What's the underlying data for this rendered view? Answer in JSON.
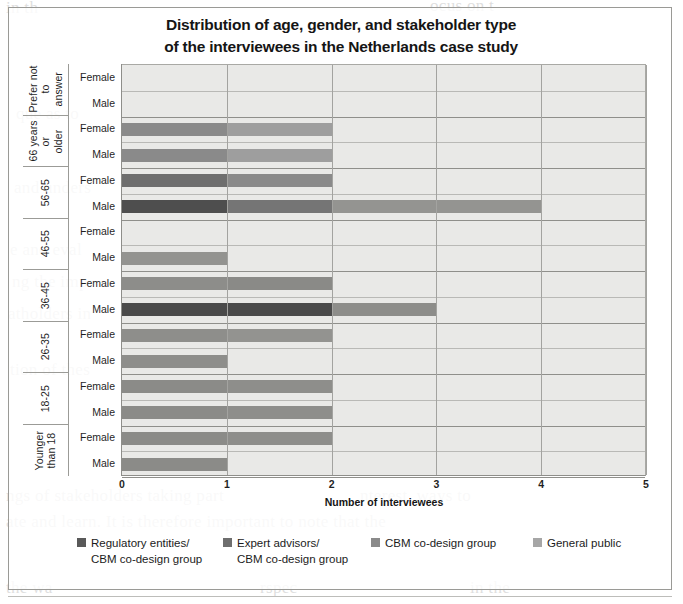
{
  "figure": {
    "title_line1": "Distribution of age, gender, and stakeholder type",
    "title_line2": "of the interviewees in the Netherlands case study"
  },
  "legend": {
    "items": [
      {
        "label": "Regulatory entities/\nCBM co-design group",
        "color": "#595959"
      },
      {
        "label": "Expert advisors/\nCBM co-design group",
        "color": "#6e6e6e"
      },
      {
        "label": "CBM co-design group",
        "color": "#8a8a8a"
      },
      {
        "label": "General public",
        "color": "#a6a6a6"
      }
    ]
  },
  "chart_data": {
    "type": "bar",
    "orientation": "horizontal",
    "stacked": true,
    "title": "Distribution of age, gender, and stakeholder type of the interviewees in the Netherlands case study",
    "xlabel": "Number of interviewees",
    "ylabel": "",
    "xlim": [
      0,
      5
    ],
    "xticks": [
      0,
      1,
      2,
      3,
      4,
      5
    ],
    "grid": true,
    "legend_position": "bottom",
    "categories": [
      "Prefer not to answer",
      "66 years or older",
      "56-65",
      "46-55",
      "36-45",
      "26-35",
      "18-25",
      "Younger than 18"
    ],
    "subcategories": [
      "Female",
      "Male"
    ],
    "series": [
      {
        "name": "Regulatory entities/ CBM co-design group",
        "color": "#595959"
      },
      {
        "name": "Expert advisors/ CBM co-design group",
        "color": "#6e6e6e"
      },
      {
        "name": "CBM co-design group",
        "color": "#8a8a8a"
      },
      {
        "name": "General public",
        "color": "#a6a6a6"
      }
    ],
    "groups": [
      {
        "age": "Prefer not to\nanswer",
        "rows": [
          {
            "gender": "Female",
            "total": 0,
            "segments": []
          },
          {
            "gender": "Male",
            "total": 0,
            "segments": []
          }
        ]
      },
      {
        "age": "66 years or\nolder",
        "rows": [
          {
            "gender": "Female",
            "total": 2,
            "segments": [
              {
                "series": "CBM co-design group",
                "value": 1,
                "color": "#8a8a8a"
              },
              {
                "series": "General public",
                "value": 1,
                "color": "#9e9e9e"
              }
            ]
          },
          {
            "gender": "Male",
            "total": 2,
            "segments": [
              {
                "series": "CBM co-design group",
                "value": 1,
                "color": "#8a8a8a"
              },
              {
                "series": "General public",
                "value": 1,
                "color": "#9e9e9e"
              }
            ]
          }
        ]
      },
      {
        "age": "56-65",
        "rows": [
          {
            "gender": "Female",
            "total": 2,
            "segments": [
              {
                "series": "Expert advisors/ CBM co-design group",
                "value": 1,
                "color": "#6e6e6e"
              },
              {
                "series": "CBM co-design group",
                "value": 1,
                "color": "#8a8a8a"
              }
            ]
          },
          {
            "gender": "Male",
            "total": 4,
            "segments": [
              {
                "series": "Regulatory entities/ CBM co-design group",
                "value": 1,
                "color": "#4e4e4e"
              },
              {
                "series": "Expert advisors/ CBM co-design group",
                "value": 1,
                "color": "#757575"
              },
              {
                "series": "CBM co-design group",
                "value": 2,
                "color": "#949491"
              }
            ]
          }
        ]
      },
      {
        "age": "46-55",
        "rows": [
          {
            "gender": "Female",
            "total": 0,
            "segments": []
          },
          {
            "gender": "Male",
            "total": 1,
            "segments": [
              {
                "series": "CBM co-design group",
                "value": 1,
                "color": "#939390"
              }
            ]
          }
        ]
      },
      {
        "age": "36-45",
        "rows": [
          {
            "gender": "Female",
            "total": 2,
            "segments": [
              {
                "series": "CBM co-design group",
                "value": 1,
                "color": "#8d8d8a"
              },
              {
                "series": "General public",
                "value": 1,
                "color": "#8a8a87"
              }
            ]
          },
          {
            "gender": "Male",
            "total": 3,
            "segments": [
              {
                "series": "Regulatory entities/ CBM co-design group",
                "value": 2,
                "color": "#4a4a4a"
              },
              {
                "series": "CBM co-design group",
                "value": 1,
                "color": "#8d8d8a"
              }
            ]
          }
        ]
      },
      {
        "age": "26-35",
        "rows": [
          {
            "gender": "Female",
            "total": 2,
            "segments": [
              {
                "series": "CBM co-design group",
                "value": 1,
                "color": "#8e8e8b"
              },
              {
                "series": "General public",
                "value": 1,
                "color": "#939390"
              }
            ]
          },
          {
            "gender": "Male",
            "total": 1,
            "segments": [
              {
                "series": "CBM co-design group",
                "value": 1,
                "color": "#8e8e8b"
              }
            ]
          }
        ]
      },
      {
        "age": "18-25",
        "rows": [
          {
            "gender": "Female",
            "total": 2,
            "segments": [
              {
                "series": "CBM co-design group",
                "value": 1,
                "color": "#8b8b88"
              },
              {
                "series": "General public",
                "value": 1,
                "color": "#8e8e8b"
              }
            ]
          },
          {
            "gender": "Male",
            "total": 2,
            "segments": [
              {
                "series": "CBM co-design group",
                "value": 1,
                "color": "#8b8b88"
              },
              {
                "series": "General public",
                "value": 1,
                "color": "#8e8e8b"
              }
            ]
          }
        ]
      },
      {
        "age": "Younger\nthan 18",
        "rows": [
          {
            "gender": "Female",
            "total": 2,
            "segments": [
              {
                "series": "CBM co-design group",
                "value": 1,
                "color": "#8b8b88"
              },
              {
                "series": "General public",
                "value": 1,
                "color": "#8e8e8b"
              }
            ]
          },
          {
            "gender": "Male",
            "total": 1,
            "segments": [
              {
                "series": "CBM co-design group",
                "value": 1,
                "color": "#8b8b88"
              }
            ]
          }
        ]
      }
    ]
  }
}
